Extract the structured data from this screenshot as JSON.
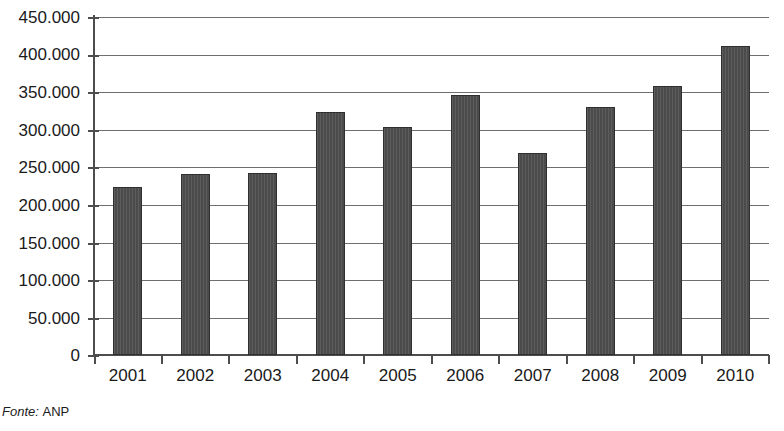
{
  "source_note": {
    "label": "Fonte:",
    "value": "ANP"
  },
  "chart_data": {
    "type": "bar",
    "title": "",
    "subtitle": "",
    "xlabel": "",
    "ylabel": "",
    "categories": [
      "2001",
      "2002",
      "2003",
      "2004",
      "2005",
      "2006",
      "2007",
      "2008",
      "2009",
      "2010"
    ],
    "values": [
      224000,
      241000,
      242000,
      323000,
      303000,
      346000,
      269000,
      330000,
      358000,
      411000
    ],
    "ylim": [
      0,
      450000
    ],
    "ytick_step": 50000,
    "ytick_labels": [
      "0",
      "50.000",
      "100.000",
      "150.000",
      "200.000",
      "250.000",
      "300.000",
      "350.000",
      "400.000",
      "450.000"
    ],
    "ytick_values": [
      0,
      50000,
      100000,
      150000,
      200000,
      250000,
      300000,
      350000,
      400000,
      450000
    ],
    "grid": true,
    "legend": false,
    "legend_position": "none",
    "bar_color": "#4b4b4b",
    "bar_border_color": "#2f2f2f",
    "gridline_color": "#6f6f6f",
    "axis_color": "#4d4d4d",
    "background_color": "#ffffff",
    "text_color": "#1a1a1a"
  }
}
